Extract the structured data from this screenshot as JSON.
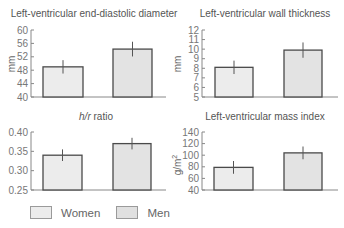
{
  "chart_data": [
    {
      "type": "bar",
      "title": "Left-ventricular end-diastolic diameter",
      "categories": [
        "Women",
        "Men"
      ],
      "values": [
        49,
        54.3
      ],
      "error": [
        2.0,
        2.2
      ],
      "ylabel": "mm",
      "ylim": [
        40,
        60
      ],
      "yticks": [
        "40",
        "44",
        "48",
        "52",
        "56",
        "60"
      ]
    },
    {
      "type": "bar",
      "title": "Left-ventricular wall thickness",
      "categories": [
        "Women",
        "Men"
      ],
      "values": [
        8.1,
        9.9
      ],
      "error": [
        0.7,
        0.8
      ],
      "ylabel": "mm",
      "ylim": [
        5,
        12
      ],
      "yticks": [
        "5",
        "6",
        "7",
        "8",
        "9",
        "10",
        "11",
        "12"
      ]
    },
    {
      "type": "bar",
      "title": "h/r ratio",
      "categories": [
        "Women",
        "Men"
      ],
      "values": [
        0.34,
        0.37
      ],
      "error": [
        0.015,
        0.015
      ],
      "ylabel": "",
      "ylim": [
        0.25,
        0.4
      ],
      "yticks": [
        "0.25",
        "0.30",
        "0.35",
        "0.40"
      ]
    },
    {
      "type": "bar",
      "title": "Left-ventricular mass index",
      "categories": [
        "Women",
        "Men"
      ],
      "values": [
        79,
        104
      ],
      "error": [
        11,
        11
      ],
      "ylabel": "g/m²",
      "ylim": [
        40,
        140
      ],
      "yticks": [
        "40",
        "60",
        "80",
        "100",
        "120",
        "140"
      ]
    }
  ],
  "panels": {
    "p1": {
      "title": "Left-ventricular end-diastolic diameter",
      "ylabel": "mm"
    },
    "p2": {
      "title": "Left-ventricular wall thickness",
      "ylabel": "mm"
    },
    "p3": {
      "title_italic": "h/r",
      "title_rest": " ratio"
    },
    "p4": {
      "title": "Left-ventricular mass index",
      "ylabel": "g/m",
      "ylabel_sup": "2"
    }
  },
  "legend": {
    "women": "Women",
    "men": "Men"
  }
}
